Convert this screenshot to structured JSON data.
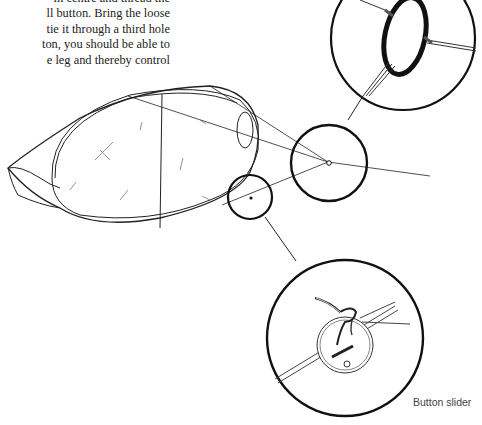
{
  "text": {
    "lines": [
      "m centre and thread the",
      "ll button. Bring the loose",
      "tie it through a third hole",
      "ton, you should be able to",
      "e leg and thereby control"
    ]
  },
  "figure": {
    "caption": "Button slider",
    "elements": [
      "kite-body-illustration",
      "ring-detail-circle",
      "bridle-point-circle",
      "button-slider-circle",
      "button-detail-circle"
    ]
  }
}
